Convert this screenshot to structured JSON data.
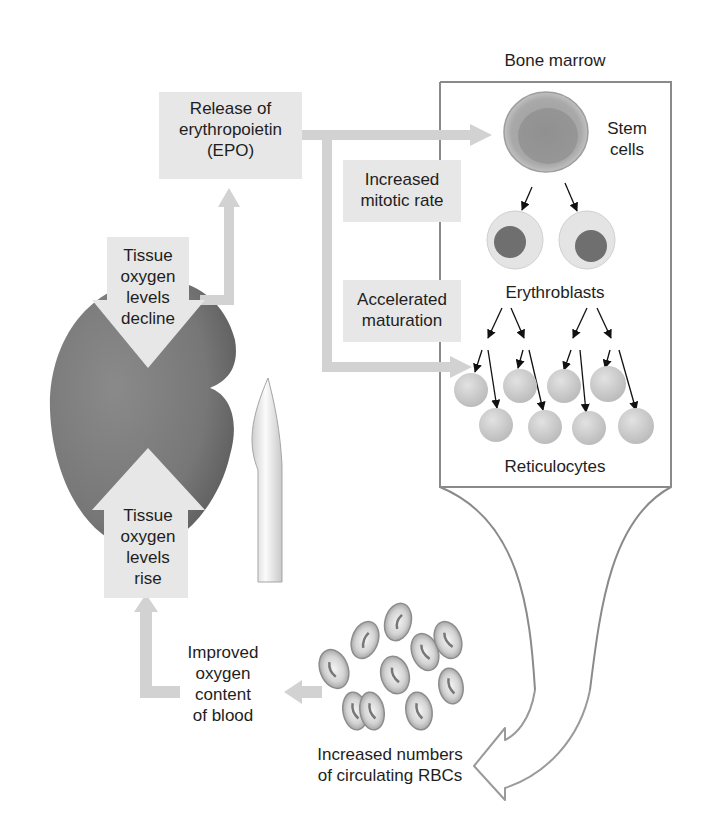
{
  "labels": {
    "release_epo": "Release of\nerythropoietin\n(EPO)",
    "bone_marrow": "Bone marrow",
    "stem_cells": "Stem\ncells",
    "increased_mitotic_rate": "Increased\nmitotic rate",
    "erythroblasts": "Erythroblasts",
    "accelerated_maturation": "Accelerated\nmaturation",
    "reticulocytes": "Reticulocytes",
    "tissue_oxygen_decline": "Tissue\noxygen\nlevels\ndecline",
    "tissue_oxygen_rise": "Tissue\noxygen\nlevels\nrise",
    "improved_oxygen": "Improved\noxygen\ncontent\nof blood",
    "increased_rbcs": "Increased numbers\nof circulating RBCs"
  },
  "colors": {
    "arrow_fill": "#d2d2d2",
    "label_box": "#e7e7e7",
    "kidney": "#7d7d7d",
    "ureter": "#e9e9e9",
    "box_border": "#8a8a8a",
    "rbc": "#bdbdbd",
    "reticulocyte": "#cfcfcf",
    "text": "#1e1e1e"
  }
}
